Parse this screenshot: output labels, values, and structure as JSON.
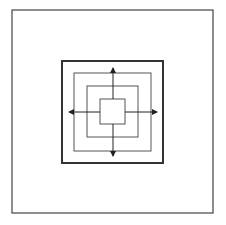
{
  "diagram": {
    "type": "nested-squares-with-cross-arrows",
    "canvas": {
      "width": 226,
      "height": 225,
      "background": "#ffffff"
    },
    "colors": {
      "frame": "#444444",
      "thick_square": "#333333",
      "thin_square": "#555555",
      "arrow": "#222222"
    },
    "frame": {
      "x": 12,
      "y": 10,
      "w": 201,
      "h": 203,
      "stroke_width": 1.2
    },
    "squares": [
      {
        "id": "thick",
        "x": 62,
        "y": 61,
        "w": 101,
        "h": 102,
        "stroke_width": 2
      },
      {
        "id": "ring-2",
        "x": 74,
        "y": 73,
        "w": 77,
        "h": 78,
        "stroke_width": 1
      },
      {
        "id": "ring-3",
        "x": 87,
        "y": 86,
        "w": 51,
        "h": 51,
        "stroke_width": 1
      },
      {
        "id": "inner",
        "x": 100,
        "y": 99,
        "w": 25,
        "h": 25,
        "stroke_width": 1
      }
    ],
    "arrows": [
      {
        "id": "up",
        "x1": 113,
        "y1": 99,
        "x2": 113,
        "y2": 68
      },
      {
        "id": "down",
        "x1": 113,
        "y1": 124,
        "x2": 113,
        "y2": 156
      },
      {
        "id": "left",
        "x1": 100,
        "y1": 112,
        "x2": 69,
        "y2": 112
      },
      {
        "id": "right",
        "x1": 125,
        "y1": 112,
        "x2": 157,
        "y2": 112
      }
    ]
  }
}
